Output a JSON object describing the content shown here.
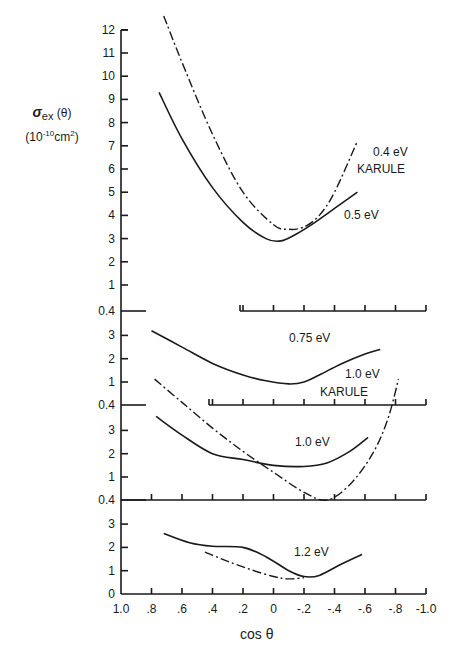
{
  "ylabel": {
    "symbol": "σ",
    "subscript": "ex",
    "arg": "(θ)",
    "units_prefix": "(10",
    "units_exp": "-10",
    "units_mid": "cm",
    "units_exp2": "2",
    "units_suffix": ")"
  },
  "xlabel": "cos θ",
  "x_ticks": [
    "1.0",
    ".8",
    ".6",
    ".4",
    ".2",
    "0",
    "-.2",
    "-.4",
    "-.6",
    "-.8",
    "-1.0"
  ],
  "chart_data": [
    {
      "type": "line",
      "panel": "top",
      "title": "",
      "xlabel": "cos θ",
      "ylabel": "σex(θ) (10^-10 cm^2)",
      "xlim": [
        1.0,
        -1.0
      ],
      "ylim": [
        0.4,
        12
      ],
      "y_ticks": [
        "0.4",
        "1",
        "2",
        "3",
        "4",
        "5",
        "6",
        "7",
        "8",
        "9",
        "10",
        "11",
        "12"
      ],
      "series": [
        {
          "name": "0.5 eV",
          "style": "solid",
          "x": [
            0.75,
            0.6,
            0.4,
            0.2,
            0.05,
            -0.05,
            -0.15,
            -0.25,
            -0.4,
            -0.55
          ],
          "y": [
            9.3,
            7.3,
            5.2,
            3.7,
            3.0,
            2.9,
            3.2,
            3.6,
            4.3,
            5.0
          ]
        },
        {
          "name": "0.4 eV KARULE",
          "style": "dash-dot",
          "x": [
            0.72,
            0.6,
            0.4,
            0.2,
            0.0,
            -0.1,
            -0.2,
            -0.3,
            -0.4,
            -0.55
          ],
          "y": [
            12.6,
            10.6,
            7.5,
            5.0,
            3.6,
            3.4,
            3.5,
            4.0,
            5.0,
            7.2
          ]
        }
      ],
      "annotations": [
        "0.4 eV",
        "KARULE",
        "0.5 eV"
      ]
    },
    {
      "type": "line",
      "panel": "second",
      "xlim": [
        1.0,
        -1.0
      ],
      "ylim": [
        0.4,
        3.5
      ],
      "y_ticks": [
        "0.4",
        "1",
        "2",
        "3"
      ],
      "series": [
        {
          "name": "0.75 eV",
          "style": "solid",
          "x": [
            0.8,
            0.6,
            0.4,
            0.2,
            0.05,
            -0.1,
            -0.2,
            -0.3,
            -0.45,
            -0.6,
            -0.7
          ],
          "y": [
            3.2,
            2.5,
            1.8,
            1.3,
            1.05,
            0.95,
            1.0,
            1.3,
            1.8,
            2.2,
            2.4
          ]
        }
      ],
      "annotations": [
        "0.75 eV"
      ]
    },
    {
      "type": "line",
      "panel": "third",
      "xlim": [
        1.0,
        -1.0
      ],
      "ylim": [
        0.4,
        3.5
      ],
      "y_ticks": [
        "0.4",
        "1",
        "2",
        "3"
      ],
      "series": [
        {
          "name": "1.0 eV",
          "style": "solid",
          "x": [
            0.77,
            0.6,
            0.4,
            0.2,
            0.0,
            -0.2,
            -0.35,
            -0.5,
            -0.62
          ],
          "y": [
            3.6,
            2.8,
            2.0,
            1.75,
            1.5,
            1.45,
            1.6,
            2.1,
            2.7
          ]
        },
        {
          "name": "1.0 eV KARULE",
          "style": "dash-dot",
          "x": [
            0.78,
            0.6,
            0.4,
            0.2,
            0.0,
            -0.2,
            -0.35,
            -0.5,
            -0.65,
            -0.75,
            -0.82
          ],
          "y": [
            5.2,
            4.2,
            3.1,
            2.1,
            1.2,
            0.6,
            0.4,
            0.8,
            2.0,
            3.5,
            5.2
          ]
        }
      ],
      "annotations": [
        "1.0 eV",
        "1.0 eV",
        "KARULE"
      ]
    },
    {
      "type": "line",
      "panel": "bottom",
      "xlim": [
        1.0,
        -1.0
      ],
      "ylim": [
        0,
        3.5
      ],
      "y_ticks": [
        "0",
        "1",
        "2",
        "3"
      ],
      "series": [
        {
          "name": "1.2 eV",
          "style": "solid",
          "x": [
            0.72,
            0.55,
            0.4,
            0.2,
            0.05,
            -0.1,
            -0.2,
            -0.3,
            -0.45,
            -0.58
          ],
          "y": [
            2.6,
            2.2,
            2.05,
            2.0,
            1.6,
            1.0,
            0.75,
            0.8,
            1.3,
            1.7
          ]
        },
        {
          "name": "1.2 eV (dash-dot)",
          "style": "dash-dot",
          "x": [
            0.45,
            0.3,
            0.15,
            0.0,
            -0.1,
            -0.2
          ],
          "y": [
            1.8,
            1.4,
            1.05,
            0.75,
            0.65,
            0.7
          ]
        }
      ],
      "annotations": [
        "1.2 eV"
      ]
    }
  ]
}
